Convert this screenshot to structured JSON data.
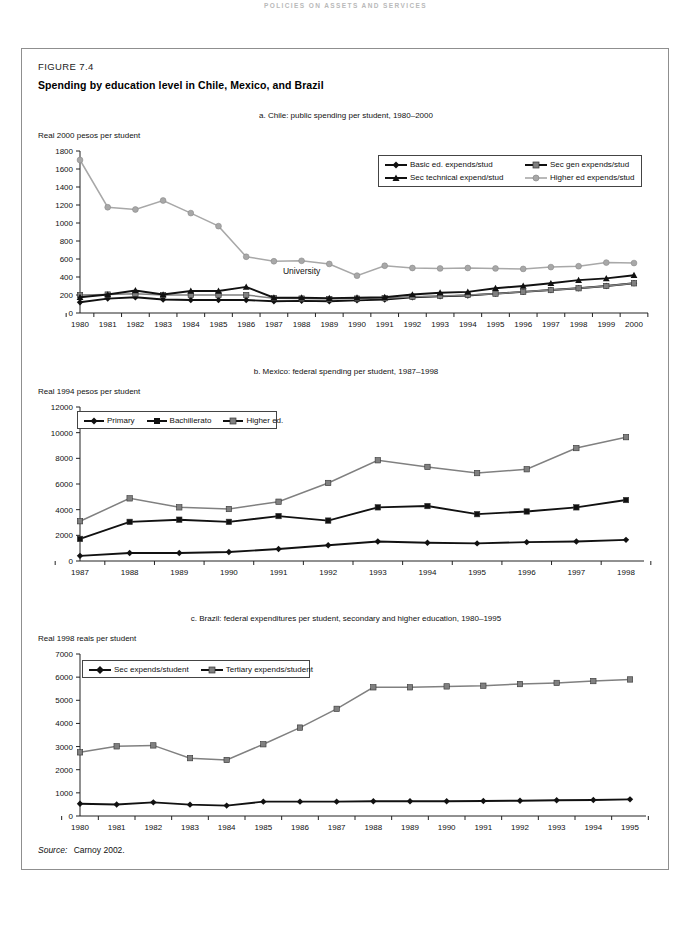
{
  "page": {
    "running_head": "POLICIES ON ASSETS AND SERVICES",
    "figure_label": "FIGURE 7.4",
    "figure_title": "Spending by education level in Chile, Mexico, and Brazil",
    "source_label": "Source:",
    "source_text": "Carnoy 2002."
  },
  "colors": {
    "dark_series": "#111111",
    "gray_series": "#808080",
    "axis": "#222222",
    "frame": "#8f8f8f"
  },
  "chart_data": [
    {
      "type": "line",
      "id": "chile",
      "title": "a. Chile: public spending per student, 1980–2000",
      "ylabel": "Real 2000 pesos per student",
      "xlabel": "",
      "grid": false,
      "legend_position": "inside-top-right",
      "ylim": [
        0,
        1800
      ],
      "yticks": [
        0,
        200,
        400,
        600,
        800,
        1000,
        1200,
        1400,
        1600,
        1800
      ],
      "categories": [
        "1980",
        "1981",
        "1982",
        "1983",
        "1984",
        "1985",
        "1986",
        "1987",
        "1988",
        "1989",
        "1990",
        "1991",
        "1992",
        "1993",
        "1994",
        "1995",
        "1996",
        "1997",
        "1998",
        "1999",
        "2000"
      ],
      "annotations": [
        {
          "text": "University",
          "x": "1988",
          "y": 430
        }
      ],
      "series": [
        {
          "name": "Basic ed. expends/stud",
          "marker": "diamond",
          "color": "#111111",
          "values": [
            120,
            160,
            175,
            150,
            145,
            145,
            145,
            130,
            135,
            130,
            140,
            150,
            175,
            185,
            195,
            215,
            235,
            255,
            275,
            300,
            330
          ]
        },
        {
          "name": "Sec gen expends/stud",
          "marker": "square",
          "color": "#808080",
          "values": [
            200,
            205,
            215,
            200,
            200,
            200,
            200,
            165,
            160,
            155,
            160,
            165,
            180,
            190,
            200,
            215,
            235,
            255,
            275,
            300,
            330
          ]
        },
        {
          "name": "Sec technical expend/stud",
          "marker": "triangle",
          "color": "#111111",
          "values": [
            175,
            205,
            250,
            205,
            245,
            245,
            290,
            170,
            170,
            165,
            170,
            175,
            205,
            225,
            235,
            275,
            300,
            330,
            365,
            385,
            420
          ]
        },
        {
          "name": "Higher ed expends/stud",
          "marker": "circle",
          "color": "#a8a8a8",
          "values": [
            1700,
            1175,
            1150,
            1250,
            1110,
            965,
            625,
            575,
            580,
            545,
            415,
            525,
            500,
            495,
            500,
            495,
            490,
            510,
            520,
            560,
            555
          ]
        }
      ]
    },
    {
      "type": "line",
      "id": "mexico",
      "title": "b. Mexico: federal spending per student, 1987–1998",
      "ylabel": "Real 1994 pesos per student",
      "xlabel": "",
      "grid": false,
      "legend_position": "inside-top-left",
      "ylim": [
        0,
        12000
      ],
      "yticks": [
        0,
        2000,
        4000,
        6000,
        8000,
        10000,
        12000
      ],
      "categories": [
        "1987",
        "1988",
        "1989",
        "1990",
        "1991",
        "1992",
        "1993",
        "1994",
        "1995",
        "1996",
        "1997",
        "1998"
      ],
      "series": [
        {
          "name": "Primary",
          "marker": "diamond",
          "color": "#111111",
          "values": [
            400,
            620,
            620,
            700,
            930,
            1230,
            1520,
            1420,
            1370,
            1470,
            1520,
            1650
          ]
        },
        {
          "name": "Bachillerato",
          "marker": "square",
          "color": "#111111",
          "values": [
            1720,
            3050,
            3220,
            3050,
            3500,
            3150,
            4180,
            4280,
            3650,
            3860,
            4180,
            4750
          ]
        },
        {
          "name": "Higher ed.",
          "marker": "square",
          "color": "#808080",
          "values": [
            3100,
            4880,
            4180,
            4050,
            4620,
            6080,
            7850,
            7330,
            6850,
            7150,
            8800,
            9650
          ]
        }
      ]
    },
    {
      "type": "line",
      "id": "brazil",
      "title": "c. Brazil: federal expenditures per student, secondary and higher education, 1980–1995",
      "ylabel": "Real 1998 reais per student",
      "xlabel": "",
      "grid": false,
      "legend_position": "inside-top-left",
      "ylim": [
        0,
        7000
      ],
      "yticks": [
        0,
        1000,
        2000,
        3000,
        4000,
        5000,
        6000,
        7000
      ],
      "categories": [
        "1980",
        "1981",
        "1982",
        "1983",
        "1984",
        "1985",
        "1986",
        "1987",
        "1988",
        "1989",
        "1990",
        "1991",
        "1992",
        "1993",
        "1994",
        "1995"
      ],
      "series": [
        {
          "name": "Sec expends/student",
          "marker": "diamond",
          "color": "#111111",
          "values": [
            530,
            500,
            590,
            490,
            450,
            620,
            620,
            620,
            640,
            640,
            640,
            650,
            660,
            680,
            690,
            720
          ]
        },
        {
          "name": "Tertiary expends/student",
          "marker": "square",
          "color": "#808080",
          "values": [
            2750,
            3010,
            3050,
            2500,
            2420,
            3100,
            3820,
            4630,
            5560,
            5560,
            5600,
            5630,
            5700,
            5750,
            5830,
            5900
          ]
        }
      ]
    }
  ]
}
